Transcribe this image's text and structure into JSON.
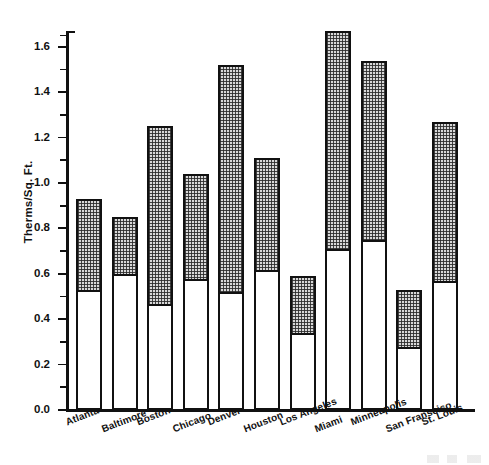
{
  "chart_data": {
    "type": "bar",
    "subtype": "stacked-bar",
    "title": "",
    "xlabel": "",
    "ylabel": "Therms/Sq. Ft.",
    "ylim": [
      0.0,
      1.67
    ],
    "grid": false,
    "legend": null,
    "y_major_ticks": [
      "0.0",
      "0.2",
      "0.4",
      "0.6",
      "0.8",
      "1.0",
      "1.2",
      "1.4",
      "1.6"
    ],
    "y_minor_tick_step": 0.1,
    "categories": [
      "Atlanta",
      "Baltimore",
      "Boston",
      "Chicago",
      "Denver",
      "Houston",
      "Los Angeles",
      "Miami",
      "Minneapolis",
      "San Fransciso",
      "St. Louis"
    ],
    "series": [
      {
        "name": "lower-segment",
        "fill": "white",
        "values": [
          0.52,
          0.59,
          0.46,
          0.57,
          0.51,
          0.61,
          0.33,
          0.7,
          0.74,
          0.27,
          0.56
        ]
      },
      {
        "name": "upper-segment",
        "fill": "stippled",
        "values": [
          0.41,
          0.26,
          0.79,
          0.47,
          1.01,
          0.5,
          0.26,
          0.97,
          0.8,
          0.26,
          0.71
        ]
      }
    ],
    "totals": [
      0.93,
      0.85,
      1.25,
      1.04,
      1.52,
      1.11,
      0.59,
      1.67,
      1.54,
      0.53,
      1.27
    ],
    "colors": {
      "axis": "#111111",
      "lower_fill": "#ffffff",
      "upper_fill": "#d8d8d8",
      "outline": "#111111",
      "background": "#ffffff"
    }
  }
}
